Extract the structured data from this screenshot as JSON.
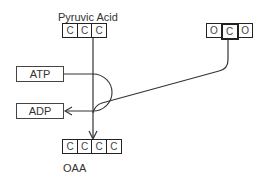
{
  "diagram": {
    "pyruvic_acid": {
      "label": "Pyruvic Acid",
      "atoms": [
        "C",
        "C",
        "C"
      ]
    },
    "co2": {
      "atoms": [
        "O",
        "C",
        "O"
      ],
      "highlighted_index": 1
    },
    "atp": {
      "label": "ATP"
    },
    "adp": {
      "label": "ADP"
    },
    "oaa": {
      "label": "OAA",
      "atoms": [
        "C",
        "C",
        "C",
        "C"
      ]
    }
  },
  "colors": {
    "line": "#333333",
    "box_border": "#222222",
    "text": "#333333"
  }
}
